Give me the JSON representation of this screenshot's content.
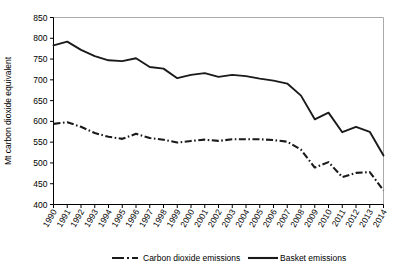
{
  "chart_data": {
    "type": "line",
    "title": "",
    "xlabel": "",
    "ylabel": "Mt carbon dioxide equivalent",
    "ylim": [
      400,
      850
    ],
    "ytick_step": 50,
    "yticks": [
      400,
      450,
      500,
      550,
      600,
      650,
      700,
      750,
      800,
      850
    ],
    "grid": false,
    "legend_position": "bottom",
    "categories": [
      "1990",
      "1991",
      "1992",
      "1993",
      "1994",
      "1995",
      "1996",
      "1997",
      "1998",
      "1999",
      "2000",
      "2001",
      "2002",
      "2003",
      "2004",
      "2005",
      "2006",
      "2007",
      "2008",
      "2009",
      "2010",
      "2011",
      "2012",
      "2013",
      "2014"
    ],
    "series": [
      {
        "name": "Carbon dioxide emissions",
        "style": "dash-dot",
        "color": "#1a1a1a",
        "values": [
          594,
          598,
          587,
          572,
          563,
          558,
          570,
          560,
          556,
          549,
          553,
          556,
          553,
          557,
          557,
          557,
          555,
          551,
          532,
          489,
          502,
          466,
          476,
          478,
          434
        ]
      },
      {
        "name": "Basket emissions",
        "style": "solid",
        "color": "#1a1a1a",
        "values": [
          783,
          792,
          772,
          757,
          747,
          745,
          752,
          731,
          727,
          704,
          712,
          716,
          707,
          712,
          709,
          703,
          698,
          691,
          662,
          605,
          621,
          574,
          587,
          575,
          518
        ]
      }
    ]
  },
  "legend": {
    "items": [
      {
        "label": "Carbon dioxide emissions",
        "style": "dash-dot"
      },
      {
        "label": "Basket emissions",
        "style": "solid"
      }
    ]
  }
}
